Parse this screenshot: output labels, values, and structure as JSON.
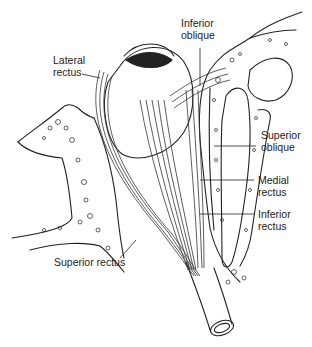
{
  "figure": {
    "labels": {
      "inferior_oblique": {
        "line1": "Inferior",
        "line2": "oblique"
      },
      "lateral_rectus": {
        "line1": "Lateral",
        "line2": "rectus"
      },
      "superior_oblique": {
        "line1": "Superior",
        "line2": "oblique"
      },
      "medial_rectus": {
        "line1": "Medial",
        "line2": "rectus"
      },
      "inferior_rectus": {
        "line1": "Inferior",
        "line2": "rectus"
      },
      "superior_rectus": {
        "line1": "Superior rectus"
      }
    },
    "colors": {
      "line": "#222222",
      "background": "#ffffff",
      "muscle_shade": "#888888"
    }
  }
}
